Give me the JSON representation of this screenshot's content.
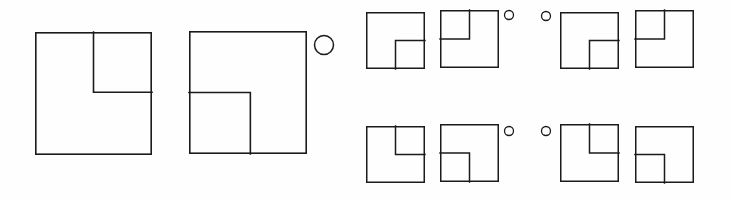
{
  "canvas": {
    "width": 730,
    "height": 201,
    "background_color": "#fefefe",
    "ink_color": "#1b1b1b",
    "description": "Hand-drawn line diagram of squares each containing a smaller inset square placed in one corner, forming a notched L shape, accompanied by small open circles used as markers"
  },
  "figures": [
    {
      "id": "large-figure-1",
      "name": "large-square-inset-top-right",
      "size_class": "large",
      "x": 35,
      "y": 32,
      "w": 117,
      "h": 123,
      "stroke_width": 1.6,
      "inner_square": {
        "corner": "top-right",
        "fraction_w": 0.5,
        "fraction_h": 0.49
      },
      "marker_circle": null
    },
    {
      "id": "large-figure-2",
      "name": "large-square-inset-bottom-left",
      "size_class": "large",
      "x": 189,
      "y": 31,
      "w": 118,
      "h": 123,
      "stroke_width": 1.6,
      "inner_square": {
        "corner": "bottom-left",
        "fraction_w": 0.52,
        "fraction_h": 0.5
      },
      "marker_circle": {
        "cx": 324,
        "cy": 45,
        "r": 9.5,
        "stroke_width": 1.5,
        "position": "right-of-figure"
      }
    },
    {
      "id": "small-figure-r1c1",
      "name": "small-square-inset-bottom-right",
      "size_class": "small",
      "row": 1,
      "col": 1,
      "x": 366,
      "y": 12,
      "w": 59,
      "h": 57,
      "stroke_width": 1.5,
      "inner_square": {
        "corner": "bottom-right",
        "fraction_w": 0.5,
        "fraction_h": 0.5
      },
      "marker_circle": null
    },
    {
      "id": "small-figure-r1c2",
      "name": "small-square-inset-top-left",
      "size_class": "small",
      "row": 1,
      "col": 2,
      "x": 440,
      "y": 10,
      "w": 59,
      "h": 58,
      "stroke_width": 1.5,
      "inner_square": {
        "corner": "top-left",
        "fraction_w": 0.5,
        "fraction_h": 0.5
      },
      "marker_circle": {
        "cx": 509,
        "cy": 15,
        "r": 4.5,
        "stroke_width": 1.3,
        "position": "right-of-figure"
      }
    },
    {
      "id": "small-figure-r1c3",
      "name": "small-square-inset-bottom-right",
      "size_class": "small",
      "row": 1,
      "col": 3,
      "x": 560,
      "y": 12,
      "w": 59,
      "h": 57,
      "stroke_width": 1.5,
      "inner_square": {
        "corner": "bottom-right",
        "fraction_w": 0.5,
        "fraction_h": 0.5
      },
      "marker_circle": {
        "cx": 546,
        "cy": 16,
        "r": 4.5,
        "stroke_width": 1.3,
        "position": "left-of-figure"
      }
    },
    {
      "id": "small-figure-r1c4",
      "name": "small-square-inset-top-left",
      "size_class": "small",
      "row": 1,
      "col": 4,
      "x": 635,
      "y": 10,
      "w": 59,
      "h": 58,
      "stroke_width": 1.5,
      "inner_square": {
        "corner": "top-left",
        "fraction_w": 0.5,
        "fraction_h": 0.5
      },
      "marker_circle": null
    },
    {
      "id": "small-figure-r2c1",
      "name": "small-square-inset-top-right",
      "size_class": "small",
      "row": 2,
      "col": 1,
      "x": 366,
      "y": 126,
      "w": 59,
      "h": 57,
      "stroke_width": 1.5,
      "inner_square": {
        "corner": "top-right",
        "fraction_w": 0.5,
        "fraction_h": 0.5
      },
      "marker_circle": null
    },
    {
      "id": "small-figure-r2c2",
      "name": "small-square-inset-bottom-left",
      "size_class": "small",
      "row": 2,
      "col": 2,
      "x": 440,
      "y": 124,
      "w": 59,
      "h": 58,
      "stroke_width": 1.5,
      "inner_square": {
        "corner": "bottom-left",
        "fraction_w": 0.5,
        "fraction_h": 0.5
      },
      "marker_circle": {
        "cx": 509,
        "cy": 131,
        "r": 4.5,
        "stroke_width": 1.3,
        "position": "right-of-figure"
      }
    },
    {
      "id": "small-figure-r2c3",
      "name": "small-square-inset-top-right",
      "size_class": "small",
      "row": 2,
      "col": 3,
      "x": 560,
      "y": 124,
      "w": 59,
      "h": 58,
      "stroke_width": 1.5,
      "inner_square": {
        "corner": "top-right",
        "fraction_w": 0.5,
        "fraction_h": 0.5
      },
      "marker_circle": {
        "cx": 546,
        "cy": 131,
        "r": 4.5,
        "stroke_width": 1.3,
        "position": "left-of-figure"
      }
    },
    {
      "id": "small-figure-r2c4",
      "name": "small-square-inset-bottom-left",
      "size_class": "small",
      "row": 2,
      "col": 4,
      "x": 635,
      "y": 126,
      "w": 59,
      "h": 57,
      "stroke_width": 1.5,
      "inner_square": {
        "corner": "bottom-left",
        "fraction_w": 0.5,
        "fraction_h": 0.5
      },
      "marker_circle": null
    }
  ]
}
